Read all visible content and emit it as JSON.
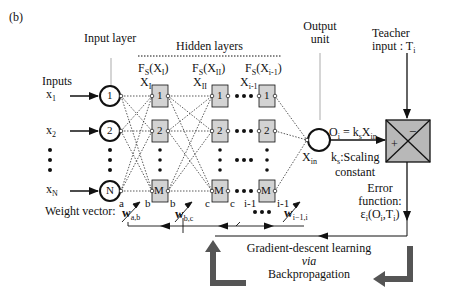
{
  "panel_label": "(b)",
  "input_layer": {
    "title": "Input layer",
    "inputs_title": "Inputs",
    "inputs": [
      {
        "name": "x",
        "sub": "1",
        "node": "1"
      },
      {
        "name": "x",
        "sub": "2",
        "node": "2"
      },
      {
        "name": "x",
        "sub": "N",
        "node": "N"
      }
    ],
    "node_end_label": "a"
  },
  "hidden_layers": {
    "title": "Hidden layers",
    "layers": [
      {
        "func": "F",
        "func_sub": "S",
        "arg": "(X",
        "arg_sub": "I",
        "arg_end": ")",
        "x_label": "X",
        "x_sub": "I",
        "in_label": "b",
        "out_label": "b"
      },
      {
        "func": "F",
        "func_sub": "S",
        "arg": "(X",
        "arg_sub": "II",
        "arg_end": ")",
        "x_label": "X",
        "x_sub": "II",
        "in_label": "c",
        "out_label": "c"
      },
      {
        "func": "F",
        "func_sub": "S",
        "arg": "(X",
        "arg_sub": "i-1",
        "arg_end": ")",
        "x_label": "X",
        "x_sub": "i-1",
        "in_label": "i-1",
        "out_label": "i-1"
      }
    ],
    "node_labels": [
      "1",
      "2",
      "M"
    ]
  },
  "output_unit": {
    "title_line1": "Output",
    "title_line2": "unit",
    "x_label": "X",
    "x_sub": "in",
    "equation": {
      "lhs": "O",
      "lhs_sub": "i",
      "eq": " = k",
      "k_sub": "s",
      "rhs": "X",
      "rhs_sub": "in"
    },
    "scaling_label": {
      "k": "k",
      "k_sub": "s",
      "text": ":Scaling",
      "line2": "constant"
    }
  },
  "teacher": {
    "line1": "Teacher",
    "line2": "input : T",
    "line2_sub": "i"
  },
  "comparator": {
    "minus": "−",
    "plus": "+"
  },
  "error_function": {
    "line1": "Error",
    "line2": "function:",
    "expr": "ε",
    "expr_sub": "i",
    "expr_args": "(O",
    "expr_args_sub1": "i",
    "expr_args_mid": ",T",
    "expr_args_sub2": "i",
    "expr_end": ")"
  },
  "weights": {
    "title": "Weight vector:",
    "w_ab": {
      "w": "w",
      "sub": "a,b"
    },
    "w_bc": {
      "w": "w",
      "sub": "b,c"
    },
    "w_i": {
      "w": "w",
      "sub": "i−1,i"
    }
  },
  "learning": {
    "line1": "Gradient-descent learning",
    "line2": "via",
    "line3": "Backpropagation"
  },
  "colors": {
    "node_fill": "#d3d3d3",
    "comparator_fill": "#b8b8b8",
    "line": "#111111",
    "arrow_gray": "#555555"
  }
}
